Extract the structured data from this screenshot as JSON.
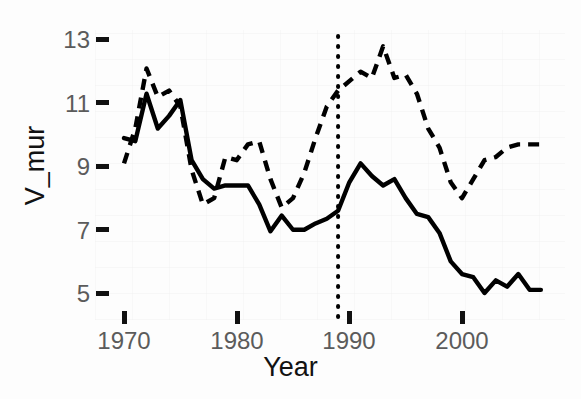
{
  "chart_data": {
    "type": "line",
    "title": "",
    "xlabel": "Year",
    "ylabel": "V_mur",
    "xlim": [
      1969.5,
      2007.5
    ],
    "ylim": [
      4.5,
      13.3
    ],
    "xticks": [
      1970,
      1980,
      1990,
      2000
    ],
    "yticks": [
      5,
      7,
      9,
      11,
      13
    ],
    "grid": false,
    "legend": "none",
    "annotations": [
      {
        "type": "vline",
        "name": "reference-line",
        "x": 1989,
        "style": "dotted",
        "color": "#000000"
      }
    ],
    "x": [
      1970,
      1971,
      1972,
      1973,
      1974,
      1975,
      1976,
      1977,
      1978,
      1979,
      1980,
      1981,
      1982,
      1983,
      1984,
      1985,
      1986,
      1987,
      1988,
      1989,
      1990,
      1991,
      1992,
      1993,
      1994,
      1995,
      1996,
      1997,
      1998,
      1999,
      2000,
      2001,
      2002,
      2003,
      2004,
      2005,
      2006,
      2007
    ],
    "series": [
      {
        "name": "solid-series",
        "style": "solid",
        "color": "#000000",
        "values": [
          9.9,
          9.8,
          11.3,
          10.2,
          10.6,
          11.1,
          9.2,
          8.6,
          8.3,
          8.4,
          8.4,
          8.4,
          7.8,
          6.95,
          7.45,
          7.0,
          7.0,
          7.2,
          7.35,
          7.6,
          8.5,
          9.1,
          8.7,
          8.4,
          8.6,
          8.0,
          7.5,
          7.4,
          6.9,
          6.0,
          5.6,
          5.5,
          5.0,
          5.4,
          5.2,
          5.6,
          5.1,
          5.1
        ]
      },
      {
        "name": "dashed-series",
        "style": "dashed",
        "color": "#000000",
        "values": [
          9.1,
          10.2,
          12.1,
          11.2,
          11.4,
          10.9,
          8.9,
          7.8,
          8.0,
          9.3,
          9.2,
          9.7,
          9.8,
          8.6,
          7.7,
          8.0,
          8.8,
          9.9,
          10.9,
          11.4,
          11.7,
          12.0,
          11.8,
          12.8,
          11.8,
          11.9,
          11.3,
          10.2,
          9.6,
          8.5,
          8.0,
          8.6,
          9.2,
          9.3,
          9.6,
          9.7,
          9.7,
          9.7
        ]
      }
    ]
  },
  "axis": {
    "y_tick_labels": [
      "13",
      "11",
      "9",
      "7",
      "5"
    ],
    "x_tick_labels": [
      "1970",
      "1980",
      "1990",
      "2000"
    ],
    "y_title": "V_mur",
    "x_title": "Year"
  }
}
